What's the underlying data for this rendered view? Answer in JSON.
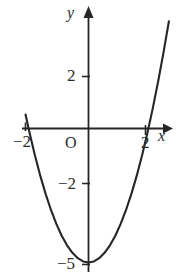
{
  "figure": {
    "background_color": "#ffffff",
    "stroke_color": "#262626",
    "axis_labels": {
      "x": "x",
      "y": "y",
      "origin": "O"
    },
    "x_tick_labels": [
      "−2",
      "2"
    ],
    "y_tick_labels": [
      "2",
      "−2",
      "−5"
    ]
  },
  "chart_data": {
    "type": "line",
    "title": "",
    "subtitle": "",
    "xlabel": "x",
    "ylabel": "y",
    "legend": [],
    "legend_position": "none",
    "grid": false,
    "xlim": [
      -2.45,
      3.1
    ],
    "ylim": [
      -5.4,
      4.7
    ],
    "x_ticks": [
      -2,
      2
    ],
    "x_tick_labels": [
      "−2",
      "2"
    ],
    "y_ticks": [
      2,
      -2,
      -5
    ],
    "y_tick_labels": [
      "2",
      "−2",
      "−5"
    ],
    "origin_label": "O",
    "axis_arrows": {
      "x": "right",
      "y": "up"
    },
    "series": [
      {
        "name": "parabola",
        "equation": "y = x^2 - 5",
        "vertex": [
          0,
          -5
        ],
        "x_intercepts": [
          -2.24,
          2.24
        ],
        "y_intercept": -5,
        "color": "#262626",
        "x": [
          -2.35,
          -2.2,
          -2.0,
          -1.8,
          -1.6,
          -1.4,
          -1.2,
          -1.0,
          -0.8,
          -0.6,
          -0.4,
          -0.2,
          0.0,
          0.2,
          0.4,
          0.6,
          0.8,
          1.0,
          1.2,
          1.4,
          1.6,
          1.8,
          2.0,
          2.2,
          2.4,
          2.6,
          2.8,
          3.0
        ],
        "y": [
          0.52,
          -0.16,
          -1.0,
          -1.76,
          -2.44,
          -3.04,
          -3.56,
          -4.0,
          -4.36,
          -4.64,
          -4.84,
          -4.96,
          -5.0,
          -4.96,
          -4.84,
          -4.64,
          -4.36,
          -4.0,
          -3.56,
          -3.04,
          -2.44,
          -1.76,
          -1.0,
          -0.16,
          0.76,
          1.76,
          2.84,
          4.0
        ]
      }
    ]
  },
  "labels": {
    "x_neg2": "−2",
    "x_pos2": "2",
    "y_pos2": "2",
    "y_neg2": "−2",
    "y_neg5": "−5",
    "x_axis": "x",
    "y_axis": "y",
    "origin": "O"
  }
}
